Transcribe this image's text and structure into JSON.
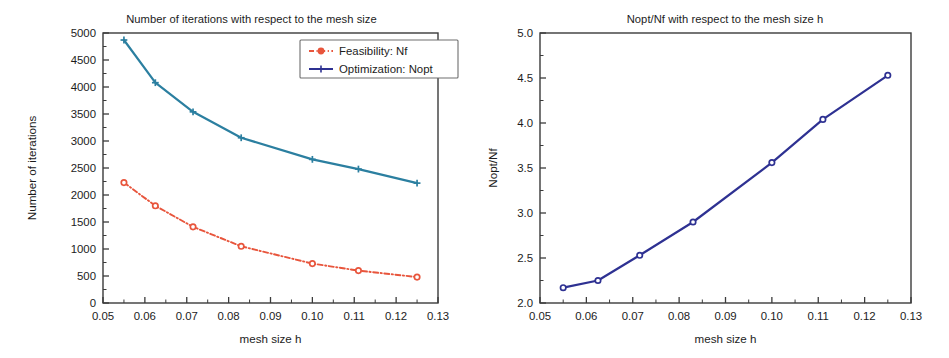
{
  "figure": {
    "background": "#ffffff",
    "panels": [
      "left",
      "right"
    ]
  },
  "left_panel": {
    "title": "Number of iterations with respect to the mesh size",
    "xlabel": "mesh size h",
    "ylabel": "Number of iterations",
    "xticklabels": [
      "0.05",
      "0.06",
      "0.07",
      "0.08",
      "0.09",
      "0.10",
      "0.11",
      "0.12",
      "0.13"
    ],
    "yticklabels": [
      "0",
      "500",
      "1000",
      "1500",
      "2000",
      "2500",
      "3000",
      "3500",
      "4000",
      "4500",
      "5000"
    ],
    "legend": {
      "items": [
        {
          "label": "Feasibility: Nf",
          "color": "#e8553c",
          "marker": "circle",
          "style": "dashdot"
        },
        {
          "label": "Optimization: Nopt",
          "color": "#2e3192",
          "marker": "plus",
          "style": "solid"
        }
      ]
    }
  },
  "right_panel": {
    "title": "Nopt/Nf with respect to the mesh size h",
    "xlabel": "mesh size h",
    "ylabel": "Nopt/Nf",
    "xticklabels": [
      "0.05",
      "0.06",
      "0.07",
      "0.08",
      "0.09",
      "0.10",
      "0.11",
      "0.12",
      "0.13"
    ],
    "yticklabels": [
      "2.0",
      "2.5",
      "3.0",
      "3.5",
      "4.0",
      "4.5",
      "5.0"
    ]
  },
  "chart_data": [
    {
      "id": "left",
      "type": "line",
      "title": "Number of iterations with respect to the mesh size",
      "xlabel": "mesh size h",
      "ylabel": "Number of iterations",
      "xlim": [
        0.05,
        0.13
      ],
      "ylim": [
        0,
        5000
      ],
      "xticks": [
        0.05,
        0.06,
        0.07,
        0.08,
        0.09,
        0.1,
        0.11,
        0.12,
        0.13
      ],
      "yticks": [
        0,
        500,
        1000,
        1500,
        2000,
        2500,
        3000,
        3500,
        4000,
        4500,
        5000
      ],
      "grid": false,
      "legend_position": "upper right",
      "x": [
        0.055,
        0.0625,
        0.0715,
        0.083,
        0.1,
        0.111,
        0.125
      ],
      "series": [
        {
          "name": "Feasibility: Nf",
          "color": "#e8553c",
          "linestyle": "dashdot",
          "marker": "circle",
          "values": [
            2230,
            1800,
            1410,
            1050,
            730,
            600,
            480
          ]
        },
        {
          "name": "Optimization: Nopt",
          "color": "#2b7fa0",
          "linestyle": "solid",
          "marker": "plus",
          "values": [
            4870,
            4080,
            3540,
            3060,
            2660,
            2480,
            2220
          ]
        }
      ]
    },
    {
      "id": "right",
      "type": "line",
      "title": "Nopt/Nf with respect to the mesh size h",
      "xlabel": "mesh size h",
      "ylabel": "Nopt/Nf",
      "xlim": [
        0.05,
        0.13
      ],
      "ylim": [
        2.0,
        5.0
      ],
      "xticks": [
        0.05,
        0.06,
        0.07,
        0.08,
        0.09,
        0.1,
        0.11,
        0.12,
        0.13
      ],
      "yticks": [
        2.0,
        2.5,
        3.0,
        3.5,
        4.0,
        4.5,
        5.0
      ],
      "grid": false,
      "legend_position": "none",
      "x": [
        0.055,
        0.0625,
        0.0715,
        0.083,
        0.1,
        0.111,
        0.125
      ],
      "series": [
        {
          "name": "Nopt/Nf",
          "color": "#2e3192",
          "linestyle": "solid",
          "marker": "circle",
          "values": [
            2.17,
            2.25,
            2.53,
            2.9,
            3.56,
            4.04,
            4.53
          ]
        }
      ]
    }
  ]
}
